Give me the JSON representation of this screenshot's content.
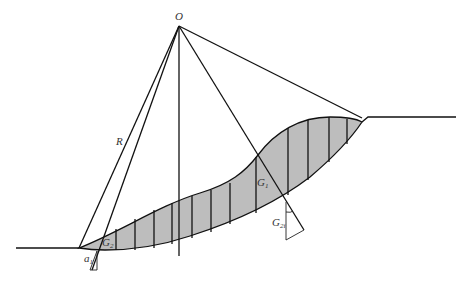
{
  "figure": {
    "type": "slope stability slice method diagram",
    "colors": {
      "sliding_mass_fill": "#bdbdbd",
      "lines": "#111111",
      "background": "#ffffff"
    }
  },
  "labels": {
    "center": "O",
    "radius": "R",
    "g1": {
      "base": "G",
      "sub": "1"
    },
    "g2": {
      "base": "G",
      "sub": "2"
    },
    "g2i": {
      "base": "G",
      "sub": "2i"
    },
    "a1": {
      "base": "a",
      "sub": "1"
    }
  },
  "geometry": {
    "center_O": [
      179,
      26
    ],
    "toe": [
      79,
      248
    ],
    "crest": [
      362,
      118
    ],
    "left_ground": [
      [
        16,
        248
      ],
      [
        79,
        248
      ]
    ],
    "right_ground": [
      [
        368,
        117
      ],
      [
        456,
        117
      ]
    ],
    "slice_count": 14
  }
}
